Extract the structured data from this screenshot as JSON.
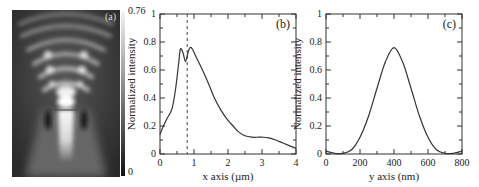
{
  "panel_a": {
    "label": "(a)",
    "colorbar": {
      "max_label": "0.76",
      "min_label": "0"
    }
  },
  "chart_data": [
    {
      "type": "line",
      "panel": "(b)",
      "title": "",
      "xlabel": "x axis (µm)",
      "ylabel": "Normalized intensity",
      "xlim": [
        0,
        4
      ],
      "ylim": [
        0,
        1
      ],
      "xticks": [
        "0",
        "1",
        "2",
        "3",
        "4"
      ],
      "yticks": [
        "0",
        "0.2",
        "0.4",
        "0.6",
        "0.8",
        "1"
      ],
      "x": [
        0,
        0.1,
        0.2,
        0.35,
        0.45,
        0.55,
        0.6,
        0.68,
        0.75,
        0.82,
        0.88,
        0.95,
        1.05,
        1.25,
        1.45,
        1.6,
        1.8,
        2.0,
        2.15,
        2.3,
        2.5,
        2.7,
        2.9,
        3.0,
        3.2,
        3.4,
        3.6,
        3.8,
        4.0
      ],
      "values": [
        0.14,
        0.2,
        0.25,
        0.32,
        0.45,
        0.65,
        0.75,
        0.72,
        0.66,
        0.72,
        0.76,
        0.75,
        0.7,
        0.6,
        0.49,
        0.4,
        0.31,
        0.24,
        0.2,
        0.16,
        0.13,
        0.12,
        0.12,
        0.12,
        0.115,
        0.1,
        0.08,
        0.06,
        0.04
      ],
      "annotations": [
        {
          "type": "vline-dashed",
          "x": 0.8
        }
      ]
    },
    {
      "type": "line",
      "panel": "(c)",
      "title": "",
      "xlabel": "y axis (nm)",
      "ylabel": "Normalized intensity",
      "xlim": [
        0,
        800
      ],
      "ylim": [
        0,
        1
      ],
      "xticks": [
        "0",
        "200",
        "400",
        "600",
        "800"
      ],
      "yticks": [
        "0",
        "0.2",
        "0.4",
        "0.6",
        "0.8",
        "1"
      ],
      "x": [
        0,
        50,
        100,
        150,
        200,
        250,
        300,
        350,
        400,
        450,
        500,
        550,
        600,
        650,
        700,
        750,
        800
      ],
      "values": [
        0.02,
        0.005,
        0.005,
        0.03,
        0.12,
        0.27,
        0.47,
        0.66,
        0.76,
        0.66,
        0.47,
        0.27,
        0.12,
        0.03,
        0.005,
        0.005,
        0.02
      ]
    }
  ]
}
